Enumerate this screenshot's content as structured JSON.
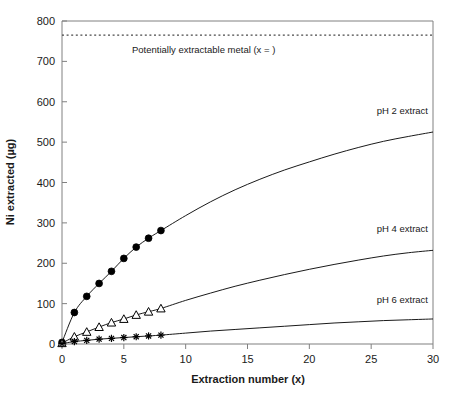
{
  "chart_data": {
    "type": "line",
    "title": "",
    "xlabel": "Extraction number (x)",
    "ylabel": "Ni extracted (µg)",
    "xlim": [
      0,
      30
    ],
    "ylim": [
      0,
      800
    ],
    "xticks": [
      0,
      5,
      10,
      15,
      20,
      25,
      30
    ],
    "yticks": [
      0,
      100,
      200,
      300,
      400,
      500,
      600,
      700,
      800
    ],
    "xtick_labels": [
      "0",
      "5",
      "10",
      "15",
      "20",
      "25",
      "30"
    ],
    "ytick_labels": [
      "0",
      "100",
      "200",
      "300",
      "400",
      "500",
      "600",
      "700",
      "800"
    ],
    "grid": false,
    "legend": "inline-labels-right",
    "annotations": [
      {
        "name": "potentially-extractable-metal",
        "text": "Potentially extractable metal (x =  )",
        "value": 765,
        "style": "dotted-horizontal-line"
      }
    ],
    "series": [
      {
        "name": "pH 2 extract",
        "label": "pH 2 extract",
        "marker": "filled-circle",
        "color": "#000000",
        "marker_x": [
          0,
          1,
          2,
          3,
          4,
          5,
          6,
          7,
          8
        ],
        "marker_y": [
          4,
          78,
          118,
          150,
          180,
          212,
          240,
          262,
          281
        ],
        "curve_x": [
          0,
          1,
          2,
          3,
          4,
          5,
          6,
          7,
          8,
          10,
          12,
          14,
          16,
          18,
          20,
          22,
          24,
          26,
          28,
          30
        ],
        "curve_y": [
          4,
          78,
          118,
          150,
          180,
          212,
          240,
          262,
          281,
          318,
          352,
          382,
          408,
          431,
          451,
          470,
          487,
          502,
          514,
          525
        ]
      },
      {
        "name": "pH 4 extract",
        "label": "pH 4 extract",
        "marker": "open-triangle",
        "color": "#000000",
        "marker_x": [
          0,
          1,
          2,
          3,
          4,
          5,
          6,
          7,
          8
        ],
        "marker_y": [
          2,
          18,
          30,
          42,
          53,
          62,
          72,
          80,
          88
        ],
        "curve_x": [
          0,
          1,
          2,
          3,
          4,
          5,
          6,
          7,
          8,
          10,
          12,
          14,
          16,
          18,
          20,
          22,
          24,
          26,
          28,
          30
        ],
        "curve_y": [
          2,
          18,
          30,
          42,
          53,
          62,
          72,
          80,
          88,
          108,
          126,
          143,
          158,
          172,
          185,
          197,
          208,
          218,
          226,
          232
        ]
      },
      {
        "name": "pH 6 extract",
        "label": "pH 6 extract",
        "marker": "asterisk",
        "color": "#000000",
        "marker_x": [
          0,
          1,
          2,
          3,
          4,
          5,
          6,
          7,
          8
        ],
        "marker_y": [
          1,
          6,
          9,
          12,
          14,
          16,
          18,
          20,
          22
        ],
        "curve_x": [
          0,
          1,
          2,
          3,
          4,
          5,
          6,
          7,
          8,
          10,
          12,
          14,
          16,
          18,
          20,
          22,
          24,
          26,
          28,
          30
        ],
        "curve_y": [
          1,
          6,
          9,
          12,
          14,
          16,
          18,
          20,
          22,
          27,
          32,
          36,
          40,
          44,
          48,
          52,
          55,
          58,
          60,
          62
        ]
      }
    ]
  },
  "caption": {
    "text": ""
  }
}
